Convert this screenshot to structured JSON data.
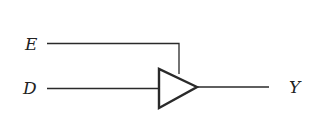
{
  "diagram": {
    "type": "tri-state buffer",
    "labels": {
      "enable": "E",
      "data": "D",
      "output": "Y"
    },
    "colors": {
      "stroke": "#2a2a2a",
      "text": "#222222",
      "background": "#ffffff"
    }
  }
}
